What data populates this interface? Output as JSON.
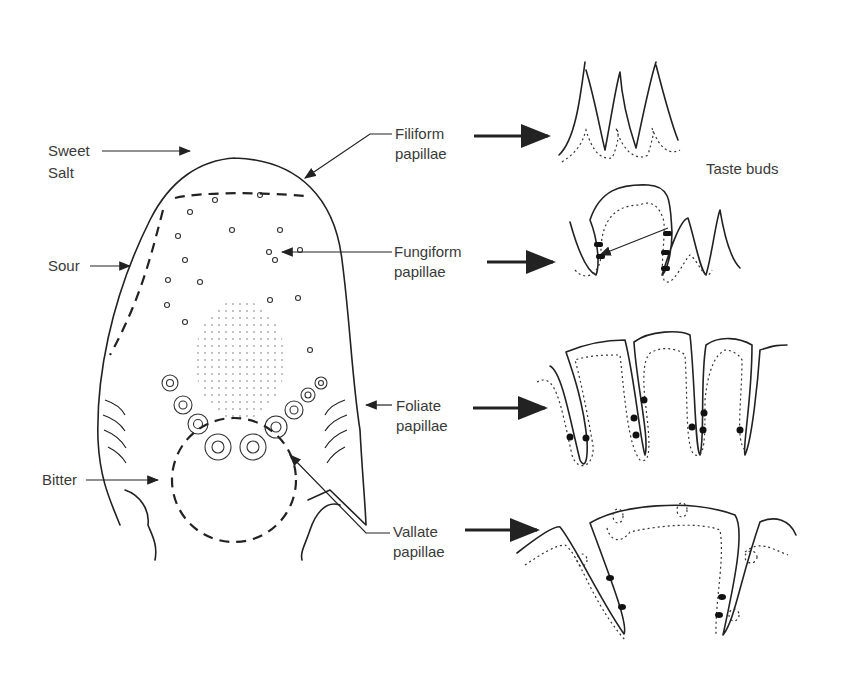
{
  "diagram": {
    "taste_regions": [
      {
        "id": "sweet",
        "label": "Sweet"
      },
      {
        "id": "salt",
        "label": "Salt"
      },
      {
        "id": "sour",
        "label": "Sour"
      },
      {
        "id": "bitter",
        "label": "Bitter"
      }
    ],
    "papillae": [
      {
        "id": "filiform",
        "line1": "Filiform",
        "line2": "papillae"
      },
      {
        "id": "fungiform",
        "line1": "Fungiform",
        "line2": "papillae"
      },
      {
        "id": "foliate",
        "line1": "Foliate",
        "line2": "papillae"
      },
      {
        "id": "vallate",
        "line1": "Vallate",
        "line2": "papillae"
      }
    ],
    "annotation": {
      "taste_buds": "Taste buds"
    },
    "colors": {
      "ink": "#222222",
      "text": "#3a3a3a",
      "background": "#ffffff"
    }
  }
}
